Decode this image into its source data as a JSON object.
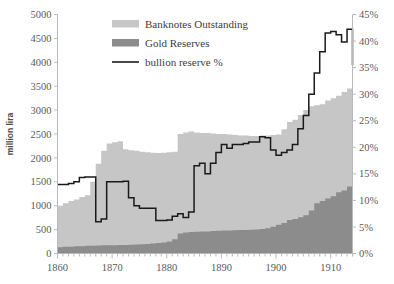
{
  "chart_data": {
    "type": "area",
    "title": "",
    "xlabel": "",
    "ylabel": "million lira",
    "y2label": "",
    "xlim": [
      1860,
      1914
    ],
    "ylim": [
      0,
      5000
    ],
    "y2lim": [
      0,
      45
    ],
    "grid": false,
    "legend_position": "top-center",
    "x_ticks": [
      1860,
      1870,
      1880,
      1890,
      1900,
      1910
    ],
    "x_tick_labels": [
      "1860",
      "1870",
      "1880",
      "1890",
      "1900",
      "1910"
    ],
    "x_minor_tick_interval": 1,
    "y_ticks": [
      0,
      500,
      1000,
      1500,
      2000,
      2500,
      3000,
      3500,
      4000,
      4500,
      5000
    ],
    "y_tick_labels": [
      "0",
      "500",
      "1000",
      "1500",
      "2000",
      "2500",
      "3000",
      "3500",
      "4000",
      "4500",
      "5000"
    ],
    "y2_ticks": [
      0,
      5,
      10,
      15,
      20,
      25,
      30,
      35,
      40,
      45
    ],
    "y2_tick_labels": [
      "0%",
      "5%",
      "10%",
      "15%",
      "20%",
      "25%",
      "30%",
      "35%",
      "40%",
      "45%"
    ],
    "x": [
      1860,
      1861,
      1862,
      1863,
      1864,
      1865,
      1866,
      1867,
      1868,
      1869,
      1870,
      1871,
      1872,
      1873,
      1874,
      1875,
      1876,
      1877,
      1878,
      1879,
      1880,
      1881,
      1882,
      1883,
      1884,
      1885,
      1886,
      1887,
      1888,
      1889,
      1890,
      1891,
      1892,
      1893,
      1894,
      1895,
      1896,
      1897,
      1898,
      1899,
      1900,
      1901,
      1902,
      1903,
      1904,
      1905,
      1906,
      1907,
      1908,
      1909,
      1910,
      1911,
      1912,
      1913,
      1914
    ],
    "series": [
      {
        "name": "Banknotes Outstanding",
        "type": "area",
        "color": "#c6c6c6",
        "values": [
          1000,
          1050,
          1100,
          1130,
          1180,
          1220,
          1500,
          1880,
          2150,
          2300,
          2330,
          2350,
          2180,
          2160,
          2150,
          2130,
          2120,
          2110,
          2100,
          2110,
          2120,
          2130,
          2500,
          2530,
          2550,
          2530,
          2520,
          2520,
          2510,
          2500,
          2500,
          2490,
          2480,
          2470,
          2470,
          2460,
          2460,
          2470,
          2470,
          2480,
          2490,
          2600,
          2750,
          2800,
          2900,
          3000,
          3080,
          3100,
          3120,
          3200,
          3250,
          3300,
          3380,
          3450,
          3500
        ]
      },
      {
        "name": "Gold Reserves",
        "type": "area",
        "color": "#8c8c8c",
        "values": [
          130,
          140,
          140,
          150,
          150,
          160,
          160,
          165,
          170,
          175,
          175,
          180,
          180,
          185,
          190,
          195,
          200,
          210,
          220,
          230,
          250,
          300,
          420,
          440,
          450,
          455,
          460,
          460,
          470,
          475,
          480,
          480,
          485,
          490,
          490,
          495,
          500,
          510,
          530,
          560,
          600,
          640,
          700,
          720,
          760,
          800,
          900,
          1050,
          1100,
          1150,
          1200,
          1280,
          1320,
          1400,
          1450
        ]
      },
      {
        "name": "bullion reserve %",
        "type": "line",
        "color": "#1a1a1a",
        "axis": "right",
        "values": [
          13.0,
          13.0,
          13.2,
          13.5,
          14.3,
          14.4,
          14.4,
          6.0,
          6.5,
          13.5,
          13.5,
          13.5,
          13.6,
          10.5,
          9.0,
          8.5,
          8.5,
          8.5,
          6.2,
          6.2,
          6.3,
          7.0,
          7.5,
          6.8,
          7.8,
          16.5,
          17.0,
          15.0,
          17.0,
          19.0,
          20.5,
          19.8,
          20.5,
          20.5,
          20.7,
          21.0,
          21.0,
          22.0,
          21.8,
          19.5,
          18.5,
          19.0,
          19.5,
          20.5,
          23.5,
          26.0,
          30.0,
          34.0,
          38.0,
          41.5,
          41.8,
          41.2,
          39.8,
          42.2,
          35.5
        ]
      }
    ]
  },
  "legend": {
    "entries": [
      {
        "label": "Banknotes Outstanding",
        "marker": "swatch",
        "color": "#c6c6c6"
      },
      {
        "label": "Gold Reserves",
        "marker": "swatch",
        "color": "#8c8c8c"
      },
      {
        "label": "bullion reserve %",
        "marker": "line",
        "color": "#1a1a1a"
      }
    ]
  }
}
